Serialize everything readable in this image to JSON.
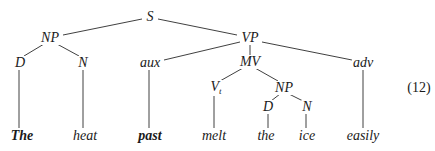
{
  "diagram": {
    "type": "syntax-tree",
    "equation_number": "(12)",
    "nodes": {
      "S": {
        "label": "S",
        "x": 150,
        "y": 18
      },
      "NP": {
        "label": "NP",
        "x": 50,
        "y": 38
      },
      "VP": {
        "label": "VP",
        "x": 250,
        "y": 38
      },
      "D1": {
        "label": "D",
        "x": 20,
        "y": 62
      },
      "N1": {
        "label": "N",
        "x": 83,
        "y": 62
      },
      "aux": {
        "label": "aux",
        "x": 150,
        "y": 62
      },
      "MV": {
        "label": "MV",
        "x": 249,
        "y": 62
      },
      "adv": {
        "label": "adv",
        "x": 363,
        "y": 62
      },
      "Vt": {
        "label": "V",
        "subscript": "t",
        "x": 214,
        "y": 88
      },
      "NP2": {
        "label": "NP",
        "x": 284,
        "y": 88
      },
      "D2": {
        "label": "D",
        "x": 268,
        "y": 107
      },
      "N2": {
        "label": "N",
        "x": 307,
        "y": 107
      }
    },
    "leaves": [
      {
        "word": "The",
        "x": 22,
        "y": 136,
        "parent": "D1",
        "bold": true
      },
      {
        "word": "heat",
        "x": 85,
        "y": 136,
        "parent": "N1",
        "bold": false
      },
      {
        "word": "past",
        "x": 150,
        "y": 136,
        "parent": "aux",
        "bold": true
      },
      {
        "word": "melt",
        "x": 214,
        "y": 136,
        "parent": "Vt",
        "bold": false
      },
      {
        "word": "the",
        "x": 266,
        "y": 136,
        "parent": "D2",
        "bold": false
      },
      {
        "word": "ice",
        "x": 307,
        "y": 136,
        "parent": "N2",
        "bold": false
      },
      {
        "word": "easily",
        "x": 363,
        "y": 136,
        "parent": "adv",
        "bold": false
      }
    ],
    "edges": [
      [
        "S",
        "NP"
      ],
      [
        "S",
        "VP"
      ],
      [
        "NP",
        "D1"
      ],
      [
        "NP",
        "N1"
      ],
      [
        "VP",
        "aux"
      ],
      [
        "VP",
        "MV"
      ],
      [
        "VP",
        "adv"
      ],
      [
        "MV",
        "Vt"
      ],
      [
        "MV",
        "NP2"
      ],
      [
        "NP2",
        "D2"
      ],
      [
        "NP2",
        "N2"
      ]
    ]
  }
}
